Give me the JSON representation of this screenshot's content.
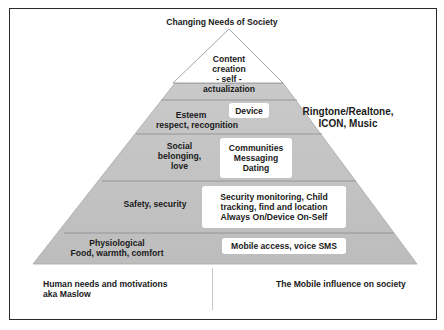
{
  "title": "Changing Needs of Society",
  "pyramid": {
    "apex": {
      "lines": [
        "Content",
        "creation",
        "- self -"
      ],
      "continuation": "actualization"
    },
    "tiers": [
      {
        "id": "esteem",
        "maslow_lines": [
          "Esteem",
          "respect, recognition"
        ],
        "mobile_lines": [
          "Device"
        ]
      },
      {
        "id": "social",
        "maslow_lines": [
          "Social",
          "belonging,",
          "love"
        ],
        "mobile_lines": [
          "Communities",
          "Messaging",
          "Dating"
        ]
      },
      {
        "id": "safety",
        "maslow_lines": [
          "Safety, security"
        ],
        "mobile_lines": [
          "Security monitoring, Child",
          "tracking, find and location",
          "Always On/Device On-Self"
        ]
      },
      {
        "id": "physiological",
        "maslow_lines": [
          "Physiological",
          "Food, warmth, comfort"
        ],
        "mobile_lines": [
          "Mobile access, voice SMS"
        ]
      }
    ]
  },
  "side_note": {
    "lines": [
      "Ringtone/Realtone,",
      "ICON, Music"
    ]
  },
  "footer": {
    "left_lines": [
      "Human needs and motivations",
      "aka Maslow"
    ],
    "right": "The Mobile influence on society"
  },
  "colors": {
    "pyramid_fill": "#c4c4c4",
    "apex_fill": "#ffffff",
    "outline": "#9a9a9a",
    "divider": "#8a8a8a"
  }
}
